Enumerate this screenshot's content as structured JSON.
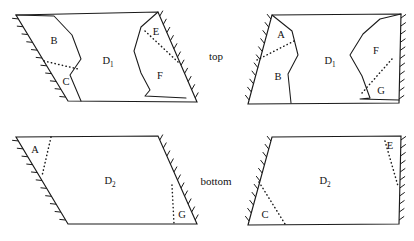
{
  "figure": {
    "name": "parallelogram-gluing-diagram",
    "background_color": "#ffffff",
    "stroke_color": "#1a1a1a",
    "width": 414,
    "height": 241
  },
  "side_labels": {
    "top": {
      "text": "top",
      "x": 216,
      "y": 57
    },
    "bottom": {
      "text": "bottom",
      "x": 216,
      "y": 182
    }
  },
  "panels": [
    {
      "id": "top-left",
      "name": "top-left-panel",
      "row": "top",
      "column": "left",
      "outline": "16,15 158,12 197,102 68,101",
      "hatched_edges": [
        {
          "name": "left-edge",
          "from": [
            16,
            15
          ],
          "to": [
            68,
            101
          ],
          "ticks": 11,
          "side": "right"
        },
        {
          "name": "right-edge",
          "from": [
            158,
            12
          ],
          "to": [
            197,
            102
          ],
          "ticks": 11,
          "side": "left"
        }
      ],
      "solid_internal": [
        "16,15 54,16 72,35 81,59 70,75 81,101",
        "158,12 141,27 134,51 141,73 150,90 145,96 186,98"
      ],
      "dotted_internal": [
        "44,61 78,69",
        "145,31 178,62"
      ],
      "labels": [
        {
          "text": "B",
          "sub": "",
          "x": 54,
          "y": 42
        },
        {
          "text": "C",
          "sub": "",
          "x": 66,
          "y": 83
        },
        {
          "text": "D",
          "sub": "1",
          "x": 108,
          "y": 62
        },
        {
          "text": "E",
          "sub": "",
          "x": 156,
          "y": 33
        },
        {
          "text": "F",
          "sub": "",
          "x": 160,
          "y": 77
        }
      ]
    },
    {
      "id": "top-right",
      "name": "top-right-panel",
      "row": "top",
      "column": "right",
      "outline": "272,15 401,14 399,103 248,104",
      "hatched_edges": [
        {
          "name": "left-edge",
          "from": [
            272,
            15
          ],
          "to": [
            248,
            104
          ],
          "ticks": 11,
          "side": "right"
        },
        {
          "name": "right-edge",
          "from": [
            401,
            14
          ],
          "to": [
            399,
            103
          ],
          "ticks": 11,
          "side": "left"
        }
      ],
      "solid_internal": [
        "272,15 292,31 298,55 288,74 291,103",
        "401,14 380,19 363,34 350,55 362,76 370,98 360,99 399,100"
      ],
      "dotted_internal": [
        "257,60 296,40",
        "362,93 392,59"
      ],
      "labels": [
        {
          "text": "A",
          "sub": "",
          "x": 281,
          "y": 36
        },
        {
          "text": "B",
          "sub": "",
          "x": 278,
          "y": 78
        },
        {
          "text": "D",
          "sub": "1",
          "x": 330,
          "y": 62
        },
        {
          "text": "F",
          "sub": "",
          "x": 376,
          "y": 52
        },
        {
          "text": "G",
          "sub": "",
          "x": 381,
          "y": 92
        }
      ]
    },
    {
      "id": "bottom-left",
      "name": "bottom-left-panel",
      "row": "bottom",
      "column": "left",
      "outline": "16,137 158,136 197,224 68,224",
      "hatched_edges": [
        {
          "name": "left-edge",
          "from": [
            16,
            137
          ],
          "to": [
            68,
            224
          ],
          "ticks": 11,
          "side": "right"
        },
        {
          "name": "right-edge",
          "from": [
            158,
            136
          ],
          "to": [
            197,
            224
          ],
          "ticks": 11,
          "side": "left"
        }
      ],
      "solid_internal": [],
      "dotted_internal": [
        "51,137 42,176",
        "172,185 174,224"
      ],
      "labels": [
        {
          "text": "A",
          "sub": "",
          "x": 35,
          "y": 151
        },
        {
          "text": "D",
          "sub": "2",
          "x": 110,
          "y": 182
        },
        {
          "text": "G",
          "sub": "",
          "x": 182,
          "y": 216
        }
      ]
    },
    {
      "id": "bottom-right",
      "name": "bottom-right-panel",
      "row": "bottom",
      "column": "right",
      "outline": "272,137 401,136 399,224 248,225",
      "hatched_edges": [
        {
          "name": "left-edge",
          "from": [
            272,
            137
          ],
          "to": [
            248,
            225
          ],
          "ticks": 11,
          "side": "right"
        },
        {
          "name": "right-edge",
          "from": [
            401,
            136
          ],
          "to": [
            399,
            224
          ],
          "ticks": 11,
          "side": "left"
        }
      ],
      "solid_internal": [],
      "dotted_internal": [
        "259,182 285,224",
        "385,141 398,186"
      ],
      "labels": [
        {
          "text": "C",
          "sub": "",
          "x": 265,
          "y": 216
        },
        {
          "text": "D",
          "sub": "2",
          "x": 325,
          "y": 182
        },
        {
          "text": "E",
          "sub": "",
          "x": 390,
          "y": 147
        }
      ]
    }
  ]
}
